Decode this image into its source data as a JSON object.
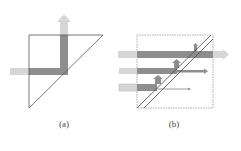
{
  "figure": {
    "panels": [
      {
        "id": "a",
        "label": "(a)",
        "description": "Right-triangle prism reflecting a horizontal beam upward"
      },
      {
        "id": "b",
        "label": "(b)",
        "description": "Beam splitter (double diagonal) splitting three horizontal beams into transmitted and reflected parts"
      }
    ]
  },
  "colors": {
    "outline": "#555555",
    "beam_dark": "#8c8c8c",
    "beam_light": "#d4d4d4",
    "box_dashed": "#888888"
  }
}
